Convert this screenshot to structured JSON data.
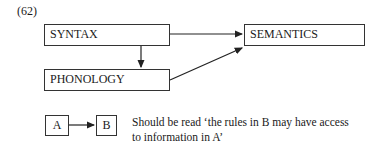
{
  "example_number": "(62)",
  "nodes": {
    "syntax": "SYNTAX",
    "semantics": "SEMANTICS",
    "phonology": "PHONOLOGY"
  },
  "edges": [
    {
      "from": "SYNTAX",
      "to": "SEMANTICS"
    },
    {
      "from": "SYNTAX",
      "to": "PHONOLOGY"
    },
    {
      "from": "PHONOLOGY",
      "to": "SEMANTICS"
    }
  ],
  "legend": {
    "a": "A",
    "b": "B",
    "line1": "Should be read ‘the rules in B may have access",
    "line2": "to information in  A’"
  }
}
